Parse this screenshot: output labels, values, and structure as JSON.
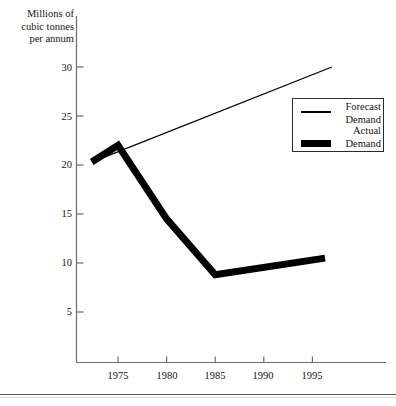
{
  "chart_data": {
    "type": "line",
    "title": "",
    "subtitle": "",
    "xlabel": "",
    "ylabel": "Millions of\ncubic tonnes\nper annum",
    "xlim": [
      1972,
      1997
    ],
    "ylim": [
      0,
      32
    ],
    "grid": false,
    "legend_position": "upper-right",
    "y_ticks": [
      30,
      25,
      20,
      15,
      10,
      5
    ],
    "y_tick_labels": [
      "30",
      "25",
      "20",
      "15",
      "10",
      "5"
    ],
    "x_ticks": [
      1975,
      1980,
      1985,
      1990,
      1995
    ],
    "x_tick_labels": [
      "1975",
      "1980",
      "1985",
      "1990",
      "1995"
    ],
    "series": [
      {
        "name": "Forecast Demand",
        "style": "thin-line",
        "color": "#000000",
        "x": [
          1972.3,
          1997.0
        ],
        "values": [
          20.3,
          30.0
        ]
      },
      {
        "name": "Actual Demand",
        "style": "thick-line",
        "color": "#000000",
        "x": [
          1972.3,
          1975.0,
          1980.0,
          1985.0,
          1996.3
        ],
        "values": [
          20.3,
          22.0,
          14.5,
          8.8,
          10.5
        ]
      }
    ]
  },
  "axis": {
    "y_title": "Millions of\ncubic tonnes\nper annum",
    "y_labels": [
      "30",
      "25",
      "20",
      "15",
      "10",
      "5"
    ],
    "x_labels": [
      "1975",
      "1980",
      "1985",
      "1990",
      "1995"
    ]
  },
  "legend": {
    "entries": [
      {
        "label": "Forecast\nDemand",
        "swatch": "thin-line"
      },
      {
        "label": "Actual\nDemand",
        "swatch": "thick-line"
      }
    ]
  },
  "colors": {
    "line": "#000000",
    "axis": "#6b6b6b",
    "text": "#141414",
    "background": "#ffffff"
  }
}
